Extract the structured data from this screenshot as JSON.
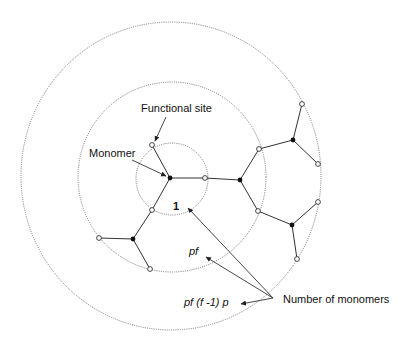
{
  "diagram": {
    "type": "branching-tree-generations",
    "labels": {
      "functional_site": "Functional site",
      "monomer": "Monomer",
      "gen0_count": "1",
      "gen1_count": "pf",
      "gen2_count": "pf (f -1) p",
      "number_of_monomers": "Number of monomers"
    },
    "shells": [
      {
        "name": "generation-0-shell",
        "cx": 171,
        "cy": 179,
        "r": 36
      },
      {
        "name": "generation-1-shell",
        "cx": 172,
        "cy": 177,
        "r": 94
      },
      {
        "name": "generation-2-shell",
        "cx": 171,
        "cy": 176,
        "r": 152
      }
    ],
    "colors": {
      "monomer": "#111111",
      "site_fill": "#ffffff",
      "line": "#333333",
      "shell": "#777777"
    }
  }
}
